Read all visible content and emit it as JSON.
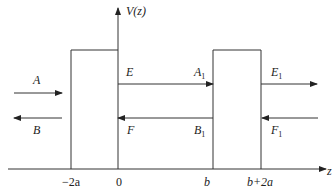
{
  "diagram": {
    "axes": {
      "y_label": "V(z)",
      "x_label": "z"
    },
    "x_ticks": [
      "−2a",
      "0",
      "b",
      "b+2a"
    ],
    "barriers": [
      {
        "name": "barrier-1",
        "from": "−2a",
        "to": "0"
      },
      {
        "name": "barrier-2",
        "from": "b",
        "to": "b+2a"
      }
    ],
    "waves": {
      "region_left": {
        "incident": "A",
        "reflected": "B"
      },
      "region_middle": {
        "right_moving": "E",
        "left_moving": "F",
        "right_moving_2": "A",
        "right_moving_2_sub": "1",
        "left_moving_2": "B",
        "left_moving_2_sub": "1"
      },
      "region_right": {
        "right_moving": "E",
        "right_moving_sub": "1",
        "left_moving": "F",
        "left_moving_sub": "1"
      }
    },
    "colors": {
      "line": "#333333",
      "background": "#ffffff"
    }
  }
}
